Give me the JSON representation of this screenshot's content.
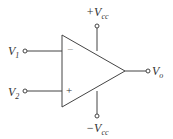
{
  "diagram": {
    "labels": {
      "v1": "V",
      "v1_sub": "1",
      "v2": "V",
      "v2_sub": "2",
      "vo": "V",
      "vo_sub": "o",
      "vcc_pos_prefix": "+V",
      "vcc_pos_sub": "cc",
      "vcc_neg_prefix": "−V",
      "vcc_neg_sub": "cc",
      "inverting": "−",
      "noninverting": "+"
    },
    "colors": {
      "stroke": "#444444",
      "text": "#333333"
    }
  }
}
